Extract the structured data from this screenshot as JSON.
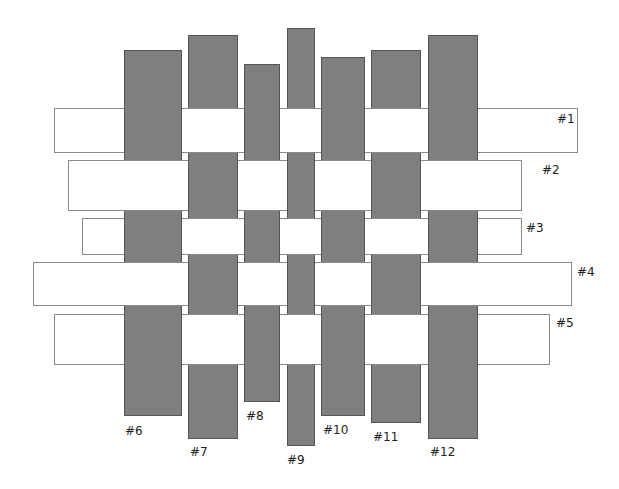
{
  "diagram": {
    "type": "basket-weave",
    "colors": {
      "strip_fill": "#ffffff",
      "strip_border": "#8a8a8a",
      "bar_fill": "#7f7f7f",
      "bar_border": "#555555",
      "label": "#222222"
    },
    "horizontal_strips": [
      {
        "id": 1,
        "label": "#1",
        "x": 54,
        "y": 108,
        "w": 524,
        "h": 45,
        "label_x": 557,
        "label_y": 113
      },
      {
        "id": 2,
        "label": "#2",
        "x": 68,
        "y": 160,
        "w": 454,
        "h": 51,
        "label_x": 542,
        "label_y": 164
      },
      {
        "id": 3,
        "label": "#3",
        "x": 82,
        "y": 218,
        "w": 440,
        "h": 37,
        "label_x": 526,
        "label_y": 222
      },
      {
        "id": 4,
        "label": "#4",
        "x": 33,
        "y": 262,
        "w": 539,
        "h": 44,
        "label_x": 577,
        "label_y": 266
      },
      {
        "id": 5,
        "label": "#5",
        "x": 54,
        "y": 314,
        "w": 496,
        "h": 51,
        "label_x": 556,
        "label_y": 317
      }
    ],
    "vertical_bars": [
      {
        "id": 6,
        "label": "#6",
        "x": 124,
        "y": 50,
        "w": 58,
        "h": 366,
        "label_x": 125,
        "label_y": 425
      },
      {
        "id": 7,
        "label": "#7",
        "x": 188,
        "y": 35,
        "w": 50,
        "h": 404,
        "label_x": 190,
        "label_y": 446
      },
      {
        "id": 8,
        "label": "#8",
        "x": 244,
        "y": 64,
        "w": 36,
        "h": 338,
        "label_x": 246,
        "label_y": 410
      },
      {
        "id": 9,
        "label": "#9",
        "x": 287,
        "y": 28,
        "w": 28,
        "h": 418,
        "label_x": 287,
        "label_y": 454
      },
      {
        "id": 10,
        "label": "#10",
        "x": 321,
        "y": 57,
        "w": 44,
        "h": 359,
        "label_x": 323,
        "label_y": 424
      },
      {
        "id": 11,
        "label": "#11",
        "x": 371,
        "y": 50,
        "w": 50,
        "h": 373,
        "label_x": 373,
        "label_y": 431
      },
      {
        "id": 12,
        "label": "#12",
        "x": 428,
        "y": 35,
        "w": 50,
        "h": 404,
        "label_x": 430,
        "label_y": 446
      }
    ],
    "weave": {
      "1": {
        "over": [
          7,
          9,
          11
        ],
        "under": [
          6,
          8,
          10,
          12
        ]
      },
      "2": {
        "over": [
          6,
          8,
          10,
          12
        ],
        "under": [
          7,
          9,
          11
        ]
      },
      "3": {
        "over": [
          7,
          9,
          11
        ],
        "under": [
          6,
          8,
          10,
          12
        ]
      },
      "4": {
        "over": [
          6,
          8,
          10,
          12
        ],
        "under": [
          7,
          9,
          11
        ]
      },
      "5": {
        "over": [
          7,
          9,
          11
        ],
        "under": [
          6,
          8,
          10,
          12
        ]
      }
    }
  }
}
